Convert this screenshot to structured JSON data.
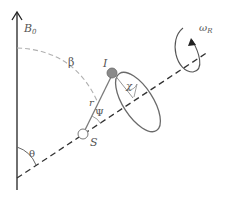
{
  "diagram": {
    "title": "",
    "labels": {
      "field": "B",
      "field_sub": "0",
      "beta": "β",
      "theta": "θ",
      "psi": "Ψ",
      "chi": "χ",
      "r": "r",
      "I": "I",
      "S": "S",
      "omega": "ω",
      "omega_sub": "R"
    },
    "nodes": [
      {
        "id": "I",
        "label": "I",
        "style": "filled gray circle"
      },
      {
        "id": "S",
        "label": "S",
        "style": "open circle"
      }
    ],
    "edges": [
      {
        "from": "S",
        "to": "I",
        "label": "r"
      }
    ],
    "colors": {
      "axis": "#333333",
      "gray": "#7a7a7a",
      "dashed_arc": "#b0b0b0",
      "node_fill": "#8a8a8a"
    }
  }
}
